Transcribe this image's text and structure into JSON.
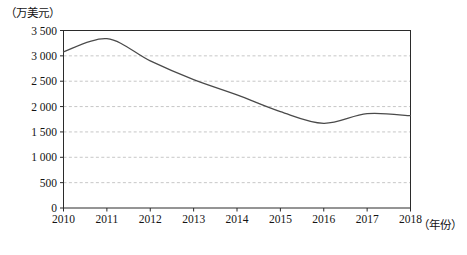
{
  "chart_data": {
    "type": "line",
    "title": "",
    "subtitle": "",
    "xlabel": "（年份）",
    "ylabel": "（万美元）",
    "categories": [
      "2010",
      "2011",
      "2012",
      "2013",
      "2014",
      "2015",
      "2016",
      "2017",
      "2018"
    ],
    "x": [
      2010,
      2011,
      2012,
      2013,
      2014,
      2015,
      2016,
      2017,
      2018
    ],
    "values": [
      3080,
      3340,
      2900,
      2530,
      2230,
      1900,
      1670,
      1860,
      1820
    ],
    "series": [
      {
        "name": "",
        "values": [
          3080,
          3340,
          2900,
          2530,
          2230,
          1900,
          1670,
          1860,
          1820
        ]
      }
    ],
    "ylim": [
      0,
      3500
    ],
    "xlim": [
      2010,
      2018
    ],
    "yticks": [
      0,
      500,
      1000,
      1500,
      2000,
      2500,
      3000,
      3500
    ],
    "ytick_labels": [
      "0",
      "500",
      "1 000",
      "1 500",
      "2 000",
      "2 500",
      "3 000",
      "3 500"
    ],
    "xtick_labels": [
      "2010",
      "2011",
      "2012",
      "2013",
      "2014",
      "2015",
      "2016",
      "2017",
      "2018"
    ],
    "grid": "horizontal-dashed",
    "legend": "none",
    "annotations": [],
    "colors": {
      "line": "#4a4a4a",
      "grid": "#b9b9b9",
      "frame": "#2b2b2b",
      "text": "#141414",
      "background": "#ffffff"
    }
  },
  "axis": {
    "y_unit_label": "（万美元）",
    "x_unit_label": "（年份）"
  }
}
